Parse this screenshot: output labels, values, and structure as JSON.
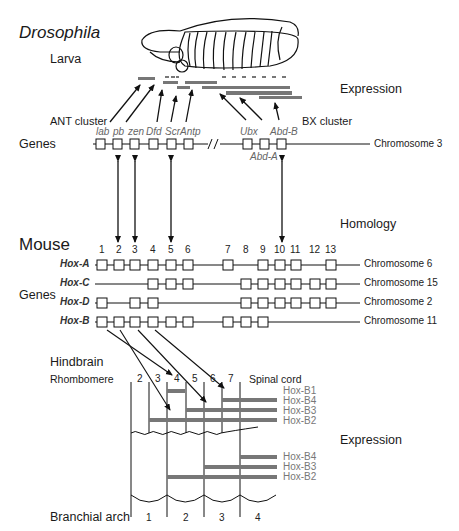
{
  "title": "Drosophila",
  "drosophila": {
    "stage_label": "Larva",
    "expression_label": "Expression",
    "ant_cluster_label": "ANT cluster",
    "bx_cluster_label": "BX cluster",
    "genes_label": "Genes",
    "chromosome_label": "Chromosome 3",
    "genes": [
      {
        "name": "lab",
        "x": 100
      },
      {
        "name": "pb",
        "x": 117
      },
      {
        "name": "zen",
        "x": 134
      },
      {
        "name": "Dfd",
        "x": 153
      },
      {
        "name": "Scr",
        "x": 172
      },
      {
        "name": "Antp",
        "x": 189
      },
      {
        "name": "Ubx",
        "x": 249
      },
      {
        "name": "Abd-A",
        "x": 266
      },
      {
        "name": "Abd-B",
        "x": 282
      }
    ]
  },
  "homology_label": "Homology",
  "mouse": {
    "title": "Mouse",
    "genes_label": "Genes",
    "paralog_numbers": [
      "1",
      "2",
      "3",
      "4",
      "5",
      "6",
      "7",
      "8",
      "9",
      "10",
      "11",
      "12",
      "13"
    ],
    "clusters": [
      {
        "name": "Hox-A",
        "chromosome": "Chromosome 6",
        "present": [
          1,
          2,
          3,
          4,
          5,
          6,
          7,
          9,
          10,
          11,
          13
        ]
      },
      {
        "name": "Hox-C",
        "chromosome": "Chromosome 15",
        "present": [
          4,
          5,
          6,
          8,
          9,
          10,
          11,
          12,
          13
        ]
      },
      {
        "name": "Hox-D",
        "chromosome": "Chromosome 2",
        "present": [
          1,
          3,
          4,
          8,
          9,
          10,
          11,
          12,
          13
        ]
      },
      {
        "name": "Hox-B",
        "chromosome": "Chromosome 11",
        "present": [
          1,
          2,
          3,
          4,
          5,
          6,
          7,
          8,
          9
        ]
      }
    ]
  },
  "hindbrain": {
    "title": "Hindbrain",
    "rhombomere_label": "Rhombomere",
    "rhombomeres": [
      "2",
      "3",
      "4",
      "5",
      "6",
      "7"
    ],
    "spinal_cord_label": "Spinal cord",
    "expression_rows": [
      "Hox-B1",
      "Hox-B4",
      "Hox-B3",
      "Hox-B2"
    ]
  },
  "branchial": {
    "expression_label": "Expression",
    "arch_label": "Branchial arch",
    "arches": [
      "1",
      "2",
      "3",
      "4"
    ],
    "expression_rows": [
      "Hox-B4",
      "Hox-B3",
      "Hox-B2"
    ]
  },
  "colors": {
    "bar": "#777777",
    "line": "#1a1a1a",
    "label_gray": "#777777"
  }
}
